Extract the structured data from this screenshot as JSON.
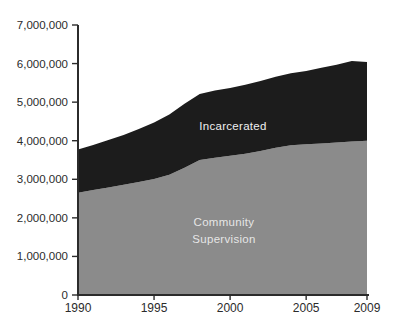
{
  "chart": {
    "area_labels": {
      "incarcerated": "Incarcerated",
      "community_line1": "Community",
      "community_line2": "Supervision"
    }
  },
  "colors": {
    "background": "#ffffff",
    "axis": "#2b2b2b",
    "tick_text": "#2b2b2b",
    "incarcerated_fill": "#1c1c1c",
    "community_fill": "#8b8b8b",
    "incarcerated_label_text": "#f0f0f0",
    "community_label_text": "rgba(255,255,255,0.8)"
  },
  "chart_data": {
    "type": "area",
    "stacked": true,
    "title": "",
    "xlabel": "",
    "ylabel": "",
    "grid": false,
    "legend": "inline-area-labels",
    "xlim": [
      1990,
      2009
    ],
    "ylim": [
      0,
      7000000
    ],
    "x": [
      1990,
      1991,
      1992,
      1993,
      1994,
      1995,
      1996,
      1997,
      1998,
      1999,
      2000,
      2001,
      2002,
      2003,
      2004,
      2005,
      2006,
      2007,
      2008,
      2009
    ],
    "series": [
      {
        "name": "Community Supervision",
        "values": [
          2650000,
          2720000,
          2790000,
          2860000,
          2930000,
          3010000,
          3120000,
          3300000,
          3500000,
          3560000,
          3610000,
          3660000,
          3730000,
          3820000,
          3880000,
          3910000,
          3930000,
          3950000,
          3980000,
          4000000
        ]
      },
      {
        "name": "Incarcerated",
        "values": [
          1120000,
          1170000,
          1230000,
          1290000,
          1370000,
          1460000,
          1560000,
          1660000,
          1710000,
          1740000,
          1760000,
          1790000,
          1820000,
          1840000,
          1870000,
          1900000,
          1960000,
          2020000,
          2090000,
          2040000
        ]
      }
    ],
    "stack_totals": [
      3770000,
      3890000,
      4020000,
      4150000,
      4300000,
      4470000,
      4680000,
      4960000,
      5210000,
      5300000,
      5370000,
      5450000,
      5550000,
      5660000,
      5750000,
      5810000,
      5890000,
      5970000,
      6070000,
      6040000
    ],
    "y_ticks": [
      {
        "value": 0,
        "label": "0"
      },
      {
        "value": 1000000,
        "label": "1,000,000"
      },
      {
        "value": 2000000,
        "label": "2,000,000"
      },
      {
        "value": 3000000,
        "label": "3,000,000"
      },
      {
        "value": 4000000,
        "label": "4,000,000"
      },
      {
        "value": 5000000,
        "label": "5,000,000"
      },
      {
        "value": 6000000,
        "label": "6,000,000"
      },
      {
        "value": 7000000,
        "label": "7,000,000"
      }
    ],
    "x_ticks": [
      {
        "value": 1990,
        "label": "1990"
      },
      {
        "value": 1995,
        "label": "1995"
      },
      {
        "value": 2000,
        "label": "2000"
      },
      {
        "value": 2005,
        "label": "2005"
      },
      {
        "value": 2009,
        "label": "2009"
      }
    ]
  }
}
